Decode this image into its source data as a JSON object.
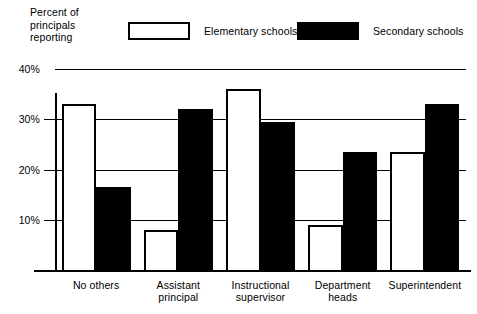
{
  "chart_data": {
    "type": "bar",
    "title": "",
    "ylabel": "Percent of principals reporting",
    "xlabel": "",
    "categories": [
      "No others",
      "Assistant principal",
      "Instructional supervisor",
      "Department heads",
      "Superintendent"
    ],
    "category_lines": [
      [
        "No others"
      ],
      [
        "Assistant",
        "principal"
      ],
      [
        "Instructional",
        "supervisor"
      ],
      [
        "Department",
        "heads"
      ],
      [
        "Superintendent"
      ]
    ],
    "series": [
      {
        "name": "Elementary schools",
        "color": "#ffffff",
        "values": [
          33,
          8,
          36,
          9,
          23.5
        ]
      },
      {
        "name": "Secondary schools",
        "color": "#000000",
        "values": [
          16.5,
          32,
          29.5,
          23.5,
          33
        ]
      }
    ],
    "ylim": [
      0,
      40
    ],
    "yticks": [
      40,
      30,
      20,
      10
    ],
    "ytick_labels": [
      "40%",
      "30%",
      "20%",
      "10%"
    ],
    "grid": true,
    "legend_position": "top"
  },
  "axis_title": {
    "line1": "Percent of",
    "line2": "principals",
    "line3": "reporting"
  },
  "legend": {
    "items": [
      {
        "label": "Elementary schools",
        "style": "open"
      },
      {
        "label": "Secondary schools",
        "style": "solid"
      }
    ]
  }
}
